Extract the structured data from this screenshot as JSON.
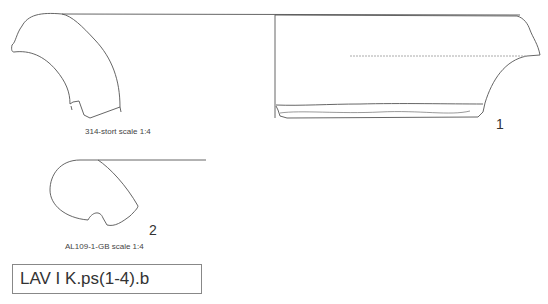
{
  "figures": [
    {
      "id": "fig-314",
      "caption": "314-stort scale 1:4"
    },
    {
      "id": "fig-1",
      "number": "1"
    },
    {
      "id": "fig-al109",
      "caption": "AL109-1-GB scale 1:4",
      "number": "2"
    }
  ],
  "label": "LAV I K.ps(1-4).b",
  "colors": {
    "line": "#555555",
    "background": "#ffffff"
  }
}
